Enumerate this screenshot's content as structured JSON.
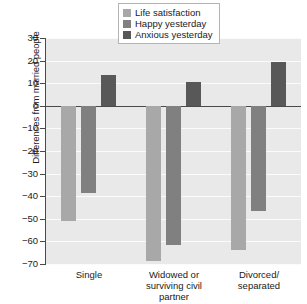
{
  "chart_data": {
    "type": "bar",
    "title": "",
    "xlabel": "",
    "ylabel": "Differences from married people",
    "categories": [
      "Single",
      "Widowed or surviving civil partner",
      "Divorced/ separated"
    ],
    "series": [
      {
        "name": "Life satisfaction",
        "color": "#a8a8a8",
        "values": [
          -51,
          -68.5,
          -63.5
        ]
      },
      {
        "name": "Happy yesterday",
        "color": "#808080",
        "values": [
          -38.5,
          -61.5,
          -46.5
        ]
      },
      {
        "name": "Anxious yesterday",
        "color": "#585858",
        "values": [
          13.5,
          10.5,
          19.5
        ]
      }
    ],
    "ylim": [
      -70,
      30
    ],
    "ytick_values": [
      30,
      20,
      10,
      0,
      -10,
      -20,
      -30,
      -40,
      -50,
      -60,
      -70
    ],
    "ytick_labels": [
      "30",
      "20",
      "10",
      "0",
      "−10",
      "−20",
      "−30",
      "−40",
      "−50",
      "−60",
      "−70"
    ],
    "grid": true,
    "legend_position": "top-center",
    "plot_background": "#e9e9e9",
    "gridline_color": "#fbfbfb",
    "axis_color": "#4a4a4a"
  },
  "category_labels": [
    {
      "lines": [
        "Single"
      ]
    },
    {
      "lines": [
        "Widowed or",
        "surviving civil",
        "partner"
      ]
    },
    {
      "lines": [
        "Divorced/",
        "separated"
      ]
    }
  ]
}
